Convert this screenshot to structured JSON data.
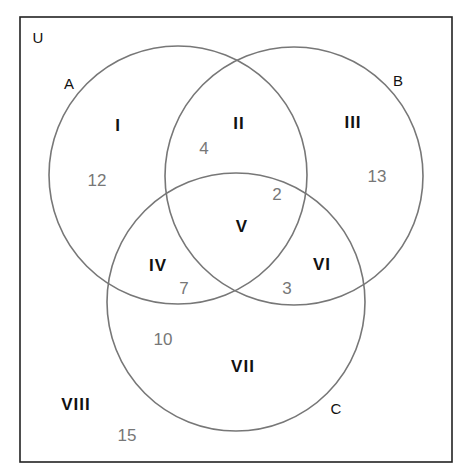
{
  "diagram": {
    "type": "venn",
    "universe_label": "U",
    "sets": [
      {
        "name": "A",
        "cx": 178,
        "cy": 175,
        "r": 129
      },
      {
        "name": "B",
        "cx": 294,
        "cy": 176,
        "r": 129
      },
      {
        "name": "C",
        "cx": 236,
        "cy": 302,
        "r": 129
      }
    ],
    "set_labels": {
      "A": "A",
      "B": "B",
      "C": "C"
    },
    "regions": [
      {
        "roman": "I",
        "description": "A only",
        "count": "12"
      },
      {
        "roman": "II",
        "description": "A and B only",
        "count": "4"
      },
      {
        "roman": "III",
        "description": "B only",
        "count": "13"
      },
      {
        "roman": "IV",
        "description": "A and C only",
        "count": "7"
      },
      {
        "roman": "V",
        "description": "A and B and C",
        "count": "2"
      },
      {
        "roman": "VI",
        "description": "B and C only",
        "count": "3"
      },
      {
        "roman": "VII",
        "description": "C only",
        "count": "10"
      },
      {
        "roman": "VIII",
        "description": "outside A, B, C",
        "count": "15"
      }
    ],
    "colors": {
      "frame": "#222222",
      "circle": "#777777",
      "count_text": "#777777",
      "label_text": "#111111"
    }
  }
}
